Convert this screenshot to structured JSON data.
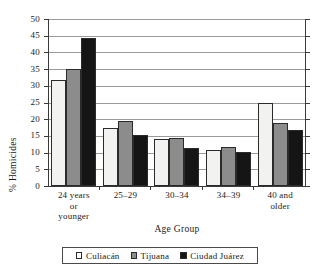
{
  "chart_data": {
    "type": "bar",
    "title": "",
    "xlabel": "Age Group",
    "ylabel": "% Homicides",
    "ylim": [
      0,
      50
    ],
    "ytick_step": 5,
    "yticks": [
      "0",
      "5",
      "10",
      "15",
      "20",
      "25",
      "30",
      "35",
      "40",
      "45",
      "50"
    ],
    "grid": true,
    "legend_position": "bottom",
    "categories": [
      "24 years or younger",
      "25–29",
      "30–34",
      "34–39",
      "40 and older"
    ],
    "category_lines": [
      [
        "24 years",
        "or",
        "younger"
      ],
      [
        "25–29"
      ],
      [
        "30–34"
      ],
      [
        "34–39"
      ],
      [
        "40 and",
        "older"
      ]
    ],
    "series": [
      {
        "name": "Culiacán",
        "color": "#f2f2f0",
        "values": [
          31.6,
          17.4,
          14.0,
          10.8,
          24.8
        ]
      },
      {
        "name": "Tijuana",
        "color": "#8c8c8c",
        "values": [
          35.0,
          19.6,
          14.4,
          11.7,
          18.8
        ]
      },
      {
        "name": "Ciudad Juárez",
        "color": "#151515",
        "values": [
          44.4,
          15.2,
          11.4,
          10.2,
          16.7
        ]
      }
    ]
  }
}
